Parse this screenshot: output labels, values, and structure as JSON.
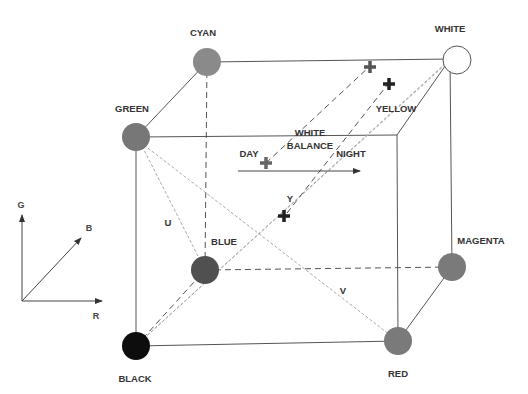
{
  "diagram": {
    "vertices": [
      {
        "id": "black",
        "label": "BLACK",
        "x": 136,
        "y": 346,
        "fill": "#111111",
        "label_x": 136,
        "label_y": 382
      },
      {
        "id": "red",
        "label": "RED",
        "x": 398,
        "y": 341,
        "fill": "#7a7a7a",
        "label_x": 398,
        "label_y": 378
      },
      {
        "id": "green",
        "label": "GREEN",
        "x": 136,
        "y": 137,
        "fill": "#777777",
        "label_x": 131,
        "label_y": 111
      },
      {
        "id": "yellow",
        "label": "YELLOW",
        "x": 397,
        "y": 135,
        "fill": "none",
        "label_x": 396,
        "label_y": 112
      },
      {
        "id": "blue",
        "label": "BLUE",
        "x": 205,
        "y": 270,
        "fill": "#4f4f4f",
        "label_x": 223,
        "label_y": 244
      },
      {
        "id": "magenta",
        "label": "MAGENTA",
        "x": 452,
        "y": 267,
        "fill": "#7a7a7a",
        "label_x": 480,
        "label_y": 243
      },
      {
        "id": "cyan",
        "label": "CYAN",
        "x": 207,
        "y": 62,
        "fill": "#888888",
        "label_x": 202,
        "label_y": 36
      },
      {
        "id": "white",
        "label": "WHITE",
        "x": 450,
        "y": 59,
        "fill": "#ffffff",
        "label_x": 450,
        "label_y": 32
      }
    ],
    "axes_labels": {
      "u": "U",
      "v": "V",
      "y": "Y"
    },
    "white_balance": {
      "title_line1": "WHITE",
      "title_line2": "BALANCE",
      "day": "DAY",
      "night": "NIGHT"
    },
    "legend_axes": {
      "g": "G",
      "b": "B",
      "r": "R"
    },
    "colors": {
      "edge": "#555555",
      "dotted": "#aaaaaa",
      "text": "#333333"
    }
  }
}
